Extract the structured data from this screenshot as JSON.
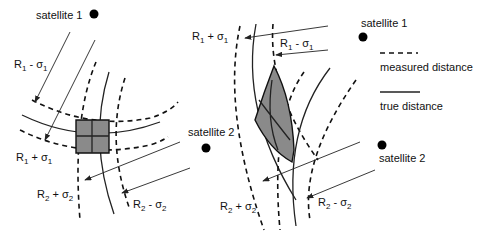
{
  "diagram": {
    "legend": {
      "measured": "measured distance",
      "true": "true distance"
    },
    "left": {
      "sat1": "satellite 1",
      "sat2": "satellite 2",
      "r1_minus": {
        "base": "R",
        "sub1": "1",
        "op": " - σ",
        "sub2": "1"
      },
      "r1_plus": {
        "base": "R",
        "sub1": "1",
        "op": " + σ",
        "sub2": "1"
      },
      "r2_plus": {
        "base": "R",
        "sub1": "2",
        "op": " + σ",
        "sub2": "2"
      },
      "r2_minus": {
        "base": "R",
        "sub1": "2",
        "op": " - σ",
        "sub2": "2"
      }
    },
    "right": {
      "sat1": "satellite 1",
      "sat2": "satellite 2",
      "r1_plus": {
        "base": "R",
        "sub1": "1",
        "op": " + σ",
        "sub2": "1"
      },
      "r1_minus": {
        "base": "R",
        "sub1": "1",
        "op": " - σ",
        "sub2": "1"
      },
      "r2_plus": {
        "base": "R",
        "sub1": "2",
        "op": " + σ",
        "sub2": "2"
      },
      "r2_minus": {
        "base": "R",
        "sub1": "2",
        "op": " - σ",
        "sub2": "2"
      }
    },
    "colors": {
      "region_fill": "#8a8a8a",
      "line": "#222222"
    }
  }
}
